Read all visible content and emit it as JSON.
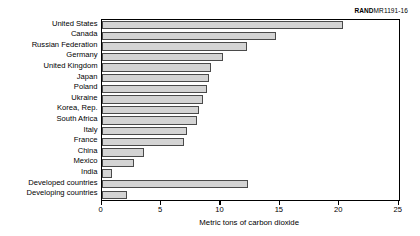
{
  "source_tag": {
    "brand": "RAND",
    "code": "MR1191-16"
  },
  "chart_data": {
    "type": "bar",
    "orientation": "horizontal",
    "title": "",
    "xlabel": "Metric tons of carbon dioxide",
    "ylabel": "",
    "xlim": [
      0,
      25
    ],
    "xticks": [
      "0",
      "5",
      "10",
      "15",
      "20",
      "25"
    ],
    "xtick_values": [
      0,
      5,
      10,
      15,
      20,
      25
    ],
    "grid": false,
    "legend": null,
    "bar_color": "#d4d4d4",
    "bar_edge_color": "#4a4a4a",
    "categories": [
      "United States",
      "Canada",
      "Russian Federation",
      "Germany",
      "United Kingdom",
      "Japan",
      "Poland",
      "Ukraine",
      "Korea, Rep.",
      "South Africa",
      "Italy",
      "France",
      "China",
      "Mexico",
      "India",
      "Developed countries",
      "Developing countries"
    ],
    "values": [
      20.3,
      14.7,
      12.2,
      10.2,
      9.2,
      9.0,
      8.9,
      8.5,
      8.2,
      8.0,
      7.2,
      6.9,
      3.6,
      2.7,
      0.9,
      12.3,
      2.1
    ]
  }
}
